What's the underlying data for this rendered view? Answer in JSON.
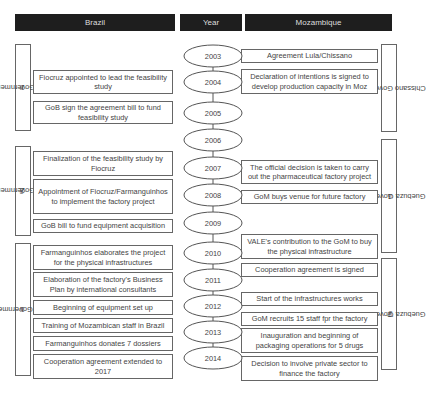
{
  "headers": {
    "brazil": "Brazil",
    "year": "Year",
    "mozambique": "Mozambique"
  },
  "brazil_governments": [
    {
      "ord": "1",
      "sup": "st",
      "name": " Lula Government"
    },
    {
      "ord": "2",
      "sup": "nd",
      "name": " Lula Government"
    },
    {
      "ord": "1",
      "sup": "st",
      "name": " Dilma Government"
    }
  ],
  "mozambique_governments": [
    {
      "ord": "",
      "sup": "",
      "name": "Chissano Government"
    },
    {
      "ord": "1",
      "sup": "st",
      "name": " Guebuza Government"
    },
    {
      "ord": "2",
      "sup": "nd",
      "name": " Guebuza Government"
    }
  ],
  "years": [
    "2003",
    "2004",
    "2005",
    "2006",
    "2007",
    "2008",
    "2009",
    "2010",
    "2011",
    "2012",
    "2013",
    "2014"
  ],
  "brazil_events": [
    "Fiocruz appointed to lead the feasibility study",
    "GoB sign the agreement bill to fund feasibility study",
    "Finalization of the feasibility study by Fiocruz",
    "Appointment of Fiocruz/Farmanguinhos to implement the factory project",
    "GoB bill to fund equipment acquisition",
    "Farmanguinhos elaborates the project for the physical infrastructures",
    "Elaboration of the factory's Business Plan by international consultants",
    "Beginning of equipment set up",
    "Training of Mozambican staff in Brazil",
    "Farmanguinhos donates 7 dossiers",
    "Cooperation agreement extended to 2017"
  ],
  "mozambique_events": [
    "Agreement Lula/Chissano",
    "Declaration of intentions is signed to develop production capacity in Moz",
    "The official decision is taken to carry out the pharmaceutical factory project",
    "GoM buys venue for future factory",
    "VALE's contribution to the GoM to buy the physical infrastructure",
    "Cooperation agreement is signed",
    "Start of the infrastructures works",
    "GoM recruits 15 staff fpr the factory",
    "Inauguration and beginning of packaging operations for 5 drugs",
    "Decision to involve private sector to finance the factory"
  ]
}
